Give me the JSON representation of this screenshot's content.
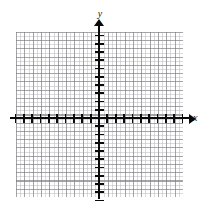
{
  "figure": {
    "type": "coordinate-plane",
    "title": "",
    "background_color": "#ffffff"
  },
  "axes": {
    "x": {
      "label": "x",
      "arrow": true,
      "color": "#0a0a0a",
      "origin_px": 99
    },
    "y": {
      "label": "y",
      "arrow": true,
      "color": "#0a0a0a",
      "origin_px": 118
    }
  },
  "grid": {
    "major_color": "#78787d",
    "minor_color": "#aaaaaf",
    "minor_per_major": 2,
    "show_minor": true,
    "show_major": true
  },
  "chart_data": {
    "type": "line",
    "title": "",
    "xlabel": "x",
    "ylabel": "y",
    "xlim": [
      -10,
      10
    ],
    "ylim": [
      -10,
      10
    ],
    "xticks": [
      -10,
      -9,
      -8,
      -7,
      -6,
      -5,
      -4,
      -3,
      -2,
      -1,
      1,
      2,
      3,
      4,
      5,
      6,
      7,
      8,
      9,
      10
    ],
    "yticks": [
      -10,
      -9,
      -8,
      -7,
      -6,
      -5,
      -4,
      -3,
      -2,
      -1,
      1,
      2,
      3,
      4,
      5,
      6,
      7,
      8,
      9,
      10
    ],
    "xtick_labels": [],
    "ytick_labels": [],
    "grid": true,
    "legend": null,
    "series": [],
    "annotations": []
  }
}
